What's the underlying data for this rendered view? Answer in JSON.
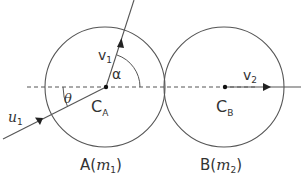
{
  "diagram": {
    "colors": {
      "stroke": "#555555",
      "text": "#333333",
      "background": "#ffffff"
    },
    "sphere_a": {
      "label": "A",
      "mass_symbol": "m",
      "mass_subscript": "1",
      "center_label": "C",
      "center_subscript": "A"
    },
    "sphere_b": {
      "label": "B",
      "mass_symbol": "m",
      "mass_subscript": "2",
      "center_label": "C",
      "center_subscript": "B"
    },
    "vectors": {
      "initial_velocity": {
        "symbol": "u",
        "subscript": "1"
      },
      "final_velocity_a": {
        "symbol": "v",
        "subscript": "1"
      },
      "final_velocity_b": {
        "symbol": "v",
        "subscript": "2"
      }
    },
    "angles": {
      "incidence": "θ",
      "deflection": "α"
    },
    "paren_open": "(",
    "paren_close": ")"
  }
}
